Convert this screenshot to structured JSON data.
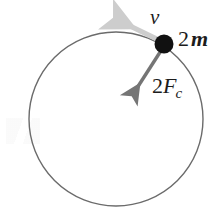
{
  "figure": {
    "type": "physics-diagram",
    "background_color": "#ffffff",
    "canvas": {
      "width": 219,
      "height": 212
    }
  },
  "circle": {
    "name": "circular-path",
    "center_x": 116,
    "center_y": 119,
    "radius": 87,
    "stroke_color": "#6b6b6b",
    "stroke_width": 1.4,
    "fill": "none"
  },
  "particle": {
    "name": "mass-point",
    "x": 164,
    "y": 44,
    "radius": 9.5,
    "fill_color": "#111111",
    "label": "2m",
    "label_number": "2",
    "label_symbol": "m"
  },
  "vectors": [
    {
      "name": "velocity-vector",
      "label": "v",
      "color": "#c9c9c9",
      "from_x": 164,
      "from_y": 44,
      "to_x": 121,
      "to_y": 23,
      "style": "tangent-to-circle"
    },
    {
      "name": "centripetal-force-vector",
      "label": "2Fc",
      "label_number": "2",
      "label_symbol": "F",
      "label_subscript": "c",
      "color": "#757575",
      "from_x": 164,
      "from_y": 44,
      "to_x": 132,
      "to_y": 96,
      "style": "points-toward-center"
    }
  ],
  "labels": {
    "velocity": "v",
    "mass_number": "2",
    "mass_symbol": "m",
    "force_number": "2",
    "force_symbol": "F",
    "force_subscript": "c"
  }
}
